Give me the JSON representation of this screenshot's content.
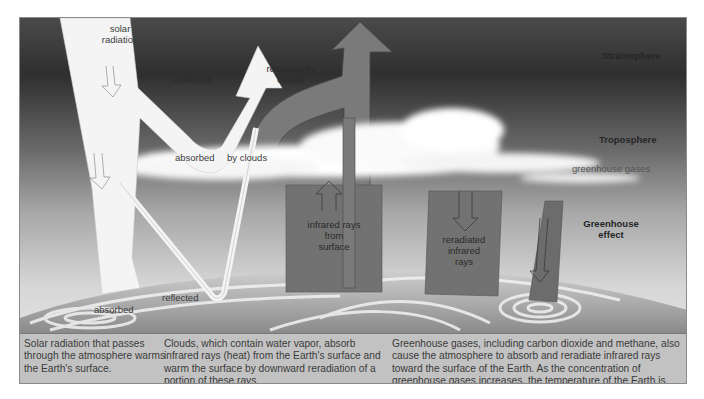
{
  "diagram": {
    "title": "Greenhouse effect",
    "zones": {
      "stratosphere": "Stratosphere",
      "troposphere": "Troposphere",
      "greenhouse_gases": "greenhouse gases",
      "greenhouse_effect_line1": "Greenhouse",
      "greenhouse_effect_line2": "effect"
    },
    "arrows": {
      "solar_line1": "solar",
      "solar_line2": "radiation",
      "reflected_top": "reflected",
      "released_line1": "released by",
      "released_line2": "clouds",
      "absorbed_clouds_a": "absorbed",
      "absorbed_clouds_b": "by clouds",
      "infrared_line1": "infrared rays",
      "infrared_line2": "from",
      "infrared_line3": "surface",
      "reradiated_line1": "reradiated",
      "reradiated_line2": "infrared",
      "reradiated_line3": "rays",
      "absorbed_surface": "absorbed",
      "reflected_surface": "reflected"
    },
    "colors": {
      "sky_dark": "#3a3a3a",
      "sky_light": "#d8d8d8",
      "beam": "#f4f4f4",
      "infrared_box": "#6e6e6e",
      "caption_bg": "#c2c2c2"
    }
  },
  "captions": [
    {
      "text": "Solar radiation that passes through the atmosphere warms the Earth's surface."
    },
    {
      "text": "Clouds, which contain water vapor, absorb infrared rays (heat) from the Earth's surface and warm the surface by downward reradiation of a portion of these rays."
    },
    {
      "text": "Greenhouse gases, including carbon dioxide and methane, also cause the atmosphere to absorb and reradiate infrared rays toward the surface of the Earth. As the concentration of greenhouse gases increases, the temperature of the Earth is expected to increase also."
    }
  ]
}
